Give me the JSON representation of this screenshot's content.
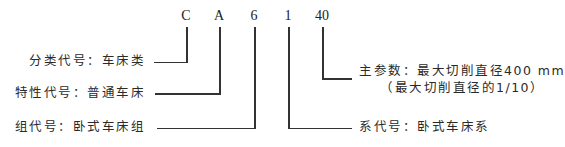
{
  "diagram": {
    "codes": [
      {
        "id": "C",
        "text": "C"
      },
      {
        "id": "A",
        "text": "A"
      },
      {
        "id": "6",
        "text": "6"
      },
      {
        "id": "1",
        "text": "1"
      },
      {
        "id": "40",
        "text": "40"
      }
    ],
    "labels": {
      "classification": "分类代号：车床类",
      "characteristic": "特性代号：普通车床",
      "group": "组代号：卧式车床组",
      "series": "系代号：卧式车床系",
      "main_param_line1": "主参数：最大切削直径400 mm",
      "main_param_line2": "（最大切削直径的1/10）"
    }
  }
}
